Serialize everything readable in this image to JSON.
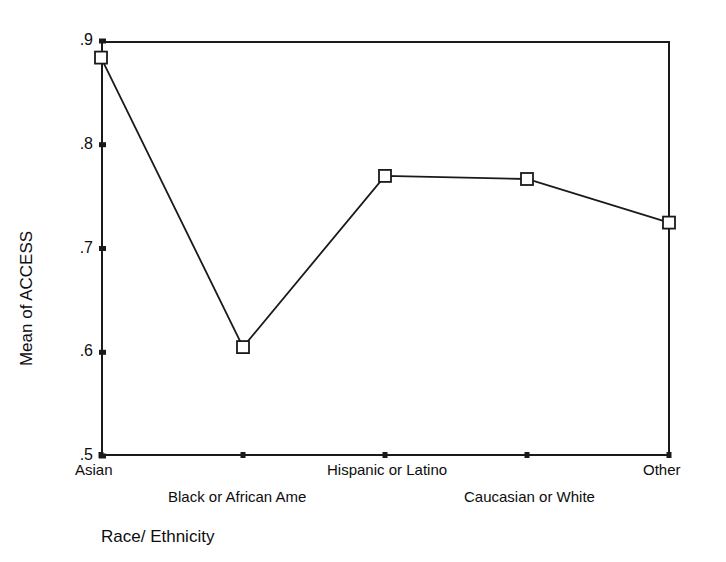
{
  "chart_data": {
    "type": "line",
    "title": "",
    "subtitle": "",
    "xlabel": "Race/ Ethnicity",
    "ylabel": "Mean of ACCESS",
    "categories": [
      "Asian",
      "Black or African Ame",
      "Hispanic or Latino",
      "Caucasian or White",
      "Other"
    ],
    "values": [
      0.884,
      0.605,
      0.77,
      0.767,
      0.725
    ],
    "series": [
      {
        "name": "Mean of ACCESS",
        "values": [
          0.884,
          0.605,
          0.77,
          0.767,
          0.725
        ]
      }
    ],
    "ylim": [
      0.5,
      0.9
    ],
    "yticks": [
      0.9,
      0.8,
      0.7,
      0.6,
      0.5
    ],
    "ytick_labels": [
      ".9",
      ".8",
      ".7",
      ".6",
      ".5"
    ],
    "xtick_labels": [
      "Asian",
      "Black or African Ame",
      "Hispanic or Latino",
      "Caucasian or White",
      "Other"
    ],
    "grid": false,
    "legend": false,
    "legend_position": "none",
    "marker": "open-square",
    "line_color": "#1a1a1a",
    "marker_color": "#1a1a1a",
    "background_color": "#ffffff",
    "axis_color": "#1a1a1a"
  },
  "axes": {
    "y": {
      "title": "Mean of ACCESS",
      "ticks": [
        {
          "label": ".9",
          "value": 0.9
        },
        {
          "label": ".8",
          "value": 0.8
        },
        {
          "label": ".7",
          "value": 0.7
        },
        {
          "label": ".6",
          "value": 0.6
        },
        {
          "label": ".5",
          "value": 0.5
        }
      ]
    },
    "x": {
      "title": "Race/ Ethnicity",
      "ticks": [
        {
          "label": "Asian",
          "row": "top"
        },
        {
          "label": "Black or African Ame",
          "row": "bottom"
        },
        {
          "label": "Hispanic or Latino",
          "row": "top"
        },
        {
          "label": "Caucasian or White",
          "row": "bottom"
        },
        {
          "label": "Other",
          "row": "top"
        }
      ]
    }
  }
}
